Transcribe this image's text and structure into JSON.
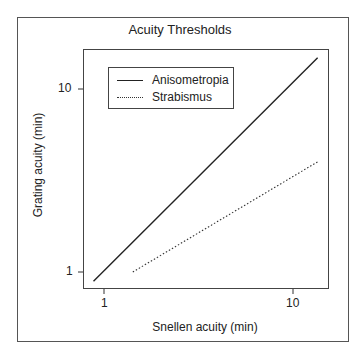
{
  "chart_data": {
    "type": "line",
    "title": "Acuity Thresholds",
    "xlabel": "Snellen acuity (min)",
    "ylabel": "Grating acuity (min)",
    "xscale": "log",
    "yscale": "log",
    "x_ticks": [
      "1",
      "10"
    ],
    "y_ticks": [
      "1",
      "10"
    ],
    "xlim": [
      0.88,
      16
    ],
    "ylim": [
      0.85,
      17
    ],
    "grid": false,
    "legend_position": "upper left",
    "series": [
      {
        "name": "Anisometropia",
        "style": "solid",
        "x": [
          0.88,
          13.5
        ],
        "y": [
          0.89,
          14.8
        ]
      },
      {
        "name": "Strabismus",
        "style": "dotted",
        "x": [
          1.42,
          13.5
        ],
        "y": [
          1.0,
          4.0
        ]
      }
    ]
  },
  "legend": {
    "items": [
      {
        "label": "Anisometropia"
      },
      {
        "label": "Strabismus"
      }
    ]
  }
}
